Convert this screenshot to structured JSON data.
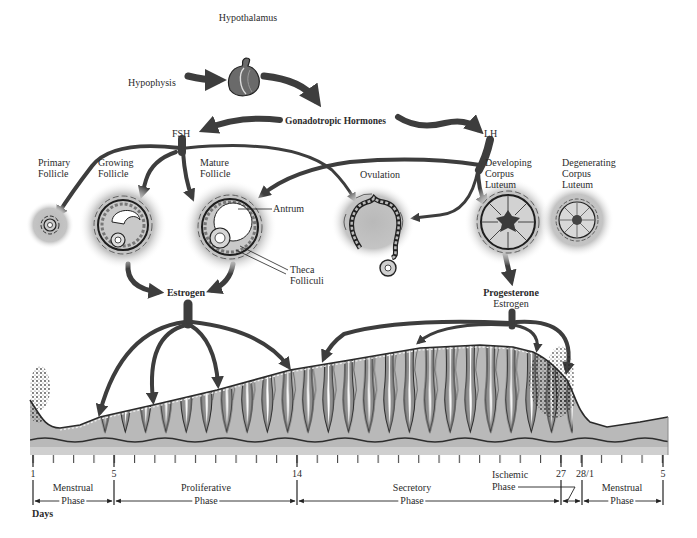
{
  "hormonal_axis": {
    "hypothalamus": "Hypothalamus",
    "hypophysis": "Hypophysis",
    "gonadotropic": "Gonadotropic Hormones",
    "fsh": "FSH",
    "lh": "LH"
  },
  "ovary": {
    "primary_follicle": [
      "Primary",
      "Follicle"
    ],
    "growing_follicle": [
      "Growing",
      "Follicle"
    ],
    "mature_follicle": [
      "Mature",
      "Follicle"
    ],
    "antrum": "Antrum",
    "theca_folliculi": [
      "Theca",
      "Folliculi"
    ],
    "ovulation": "Ovulation",
    "developing_corpus_luteum": [
      "Developing",
      "Corpus",
      "Luteum"
    ],
    "degenerating_corpus_luteum": [
      "Degenerating",
      "Corpus",
      "Luteum"
    ]
  },
  "hormones": {
    "follicular_output": "Estrogen",
    "luteal_output": [
      "Progesterone",
      "Estrogen"
    ]
  },
  "timeline": {
    "days_label": "Days",
    "day_markers": [
      "1",
      "5",
      "14",
      "27",
      "28/1",
      "5"
    ],
    "phases": [
      {
        "name": "Menstrual",
        "suffix": "Phase"
      },
      {
        "name": "Proliferative",
        "suffix": "Phase"
      },
      {
        "name": "Secretory",
        "suffix": "Phase"
      },
      {
        "name": "Menstrual",
        "suffix": "Phase"
      }
    ],
    "ischemic_phase": [
      "Ischemic",
      "Phase"
    ]
  },
  "colors": {
    "arrow": "#3d3d3d",
    "tissue": "#b9b9b9",
    "halo": "#bdbdbd",
    "basal_band": "#cfcfcf"
  }
}
